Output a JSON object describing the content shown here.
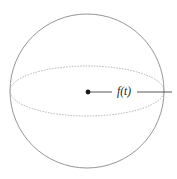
{
  "figure": {
    "type": "geometric-diagram",
    "width": 177,
    "height": 179,
    "background_color": "#ffffff",
    "label": "f(t)",
    "sphere": {
      "name": "sphere-outline",
      "center_x": 87,
      "center_y": 91,
      "radius": 77,
      "stroke_color": "#8a8a8a",
      "stroke_width": 0.9,
      "fill": "none"
    },
    "equator": {
      "name": "equator-ellipse",
      "center_x": 87,
      "center_y": 91,
      "radius_x": 77,
      "radius_y": 25,
      "stroke_color": "#a8a8a8",
      "stroke_width": 0.9,
      "stroke_style": "dotted",
      "dash_pattern": "0.7 2.1",
      "fill": "none"
    },
    "center_point": {
      "name": "center-dot",
      "x": 88,
      "y": 92,
      "radius": 2.4,
      "fill_color": "#1a1a1a"
    },
    "leader_line": {
      "name": "leader-line",
      "stroke_color": "#444444",
      "stroke_width": 0.9,
      "segment_left_x1": 90,
      "segment_left_x2": 112,
      "segment_right_x1": 137,
      "segment_right_x2": 172,
      "y": 92
    },
    "label_position": {
      "x": 124,
      "y": 92
    }
  }
}
